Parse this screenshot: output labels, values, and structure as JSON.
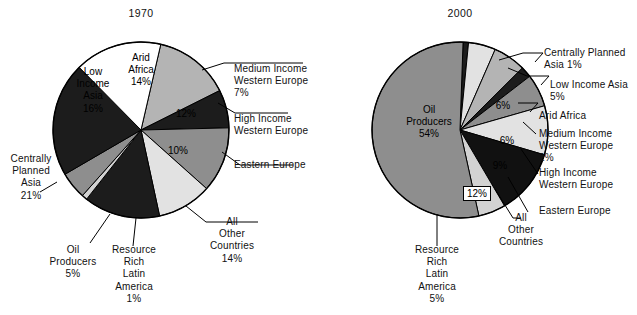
{
  "figure": {
    "background": "#ffffff",
    "line_color": "#000000"
  },
  "chart_data": [
    {
      "type": "pie",
      "title": "1970",
      "center": [
        141,
        130
      ],
      "radius": 88,
      "start_angle_deg": -77,
      "direction": "clockwise",
      "categories": [
        "Arid Africa",
        "Medium Income Western Europe",
        "High Income Western Europe",
        "Eastern Europe",
        "All Other Countries",
        "Resource Rich Latin America",
        "Oil Producers",
        "Centrally Planned Asia",
        "Low Income Asia"
      ],
      "values": [
        14,
        7,
        12,
        10,
        14,
        1,
        5,
        21,
        16
      ],
      "unit": "%",
      "colors": [
        "#b4b4b4",
        "#1c1c1c",
        "#8e8e8e",
        "#e2e2e2",
        "#1c1c1c",
        "#d2d2d2",
        "#8e8e8e",
        "#1c1c1c",
        "#ffffff"
      ],
      "slices": [
        {
          "label": "Arid Africa",
          "value": 14,
          "fill": "#b4b4b4",
          "label_in_pie": true,
          "label_text": "Arid\nAfrica\n14%"
        },
        {
          "label": "Medium Income Western Europe",
          "value": 7,
          "fill": "#1c1c1c",
          "label_in_pie": false,
          "label_text": "Medium Income\nWestern Europe\n7%"
        },
        {
          "label": "High Income Western Europe",
          "value": 12,
          "fill": "#8e8e8e",
          "label_in_pie": "value-only",
          "label_text": "High Income\nWestern Europe",
          "value_text": "12%"
        },
        {
          "label": "Eastern Europe",
          "value": 10,
          "fill": "#e2e2e2",
          "label_in_pie": "value-only",
          "label_text": "Eastern Europe",
          "value_text": "10%"
        },
        {
          "label": "All Other Countries",
          "value": 14,
          "fill": "#1c1c1c",
          "label_in_pie": false,
          "label_text": "All\nOther\nCountries\n14%"
        },
        {
          "label": "Resource Rich Latin America",
          "value": 1,
          "fill": "#d2d2d2",
          "label_in_pie": false,
          "label_text": "Resource\nRich\nLatin\nAmerica\n1%"
        },
        {
          "label": "Oil Producers",
          "value": 5,
          "fill": "#8e8e8e",
          "label_in_pie": false,
          "label_text": "Oil\nProducers\n5%"
        },
        {
          "label": "Centrally Planned Asia",
          "value": 21,
          "fill": "#1c1c1c",
          "label_in_pie": false,
          "label_text": "Centrally\nPlanned\nAsia\n21%"
        },
        {
          "label": "Low Income Asia",
          "value": 16,
          "fill": "#ffffff",
          "label_in_pie": true,
          "label_text": "Low\nIncome\nAsia\n16%"
        }
      ]
    },
    {
      "type": "pie",
      "title": "2000",
      "center": [
        460,
        130
      ],
      "radius": 88,
      "start_angle_deg": -88,
      "direction": "clockwise",
      "categories": [
        "Centrally Planned Asia",
        "Low Income Asia",
        "Arid Africa",
        "Medium Income Western Europe",
        "High Income Western Europe",
        "Eastern Europe",
        "All Other Countries",
        "Resource Rich Latin America",
        "Oil Producers"
      ],
      "values": [
        1,
        5,
        6,
        2,
        6,
        9,
        12,
        5,
        54
      ],
      "unit": "%",
      "colors": [
        "#1c1c1c",
        "#e2e2e2",
        "#b4b4b4",
        "#1c1c1c",
        "#8e8e8e",
        "#e2e2e2",
        "#111111",
        "#d2d2d2",
        "#8e8e8e"
      ],
      "slices": [
        {
          "label": "Centrally Planned Asia",
          "value": 1,
          "fill": "#1c1c1c",
          "label_in_pie": false,
          "label_text": "Centrally Planned\nAsia  1%"
        },
        {
          "label": "Low Income Asia",
          "value": 5,
          "fill": "#e2e2e2",
          "label_in_pie": false,
          "label_text": "Low Income Asia\n5%"
        },
        {
          "label": "Arid Africa",
          "value": 6,
          "fill": "#b4b4b4",
          "label_in_pie": "value-only",
          "label_text": "Arid Africa",
          "value_text": "6%"
        },
        {
          "label": "Medium Income Western Europe",
          "value": 2,
          "fill": "#1c1c1c",
          "label_in_pie": false,
          "label_text": "Medium Income\nWestern Europe\n2%"
        },
        {
          "label": "High Income Western Europe",
          "value": 6,
          "fill": "#8e8e8e",
          "label_in_pie": "value-only",
          "label_text": "High Income\nWestern Europe",
          "value_text": "6%"
        },
        {
          "label": "Eastern Europe",
          "value": 9,
          "fill": "#e2e2e2",
          "label_in_pie": "value-only",
          "label_text": "Eastern Europe",
          "value_text": "9%"
        },
        {
          "label": "All Other Countries",
          "value": 12,
          "fill": "#111111",
          "label_in_pie": "boxed",
          "label_text": "All\nOther\nCountries",
          "value_text": "12%"
        },
        {
          "label": "Resource Rich Latin America",
          "value": 5,
          "fill": "#d2d2d2",
          "label_in_pie": false,
          "label_text": "Resource\nRich\nLatin\nAmerica\n5%"
        },
        {
          "label": "Oil Producers",
          "value": 54,
          "fill": "#8e8e8e",
          "label_in_pie": true,
          "label_text": "Oil\nProducers\n54%"
        }
      ]
    }
  ],
  "left": {
    "title": "1970",
    "arid_africa": "Arid\nAfrica\n14%",
    "low_income_asia": "Low\nIncome\nAsia\n16%",
    "high_income_value": "12%",
    "eastern_europe_value": "10%",
    "medium_income_we": "Medium Income\nWestern Europe\n7%",
    "high_income_we": "High Income\nWestern Europe",
    "eastern_europe": "Eastern Europe",
    "all_other": "All\nOther\nCountries\n14%",
    "resource_rich": "Resource\nRich\nLatin\nAmerica\n1%",
    "oil_producers": "Oil\nProducers\n5%",
    "centrally_planned": "Centrally\nPlanned\nAsia\n21%"
  },
  "right": {
    "title": "2000",
    "oil_producers": "Oil\nProducers\n54%",
    "arid_africa_value": "6%",
    "high_income_value": "6%",
    "eastern_europe_value": "9%",
    "all_other_value": "12%",
    "centrally_planned": "Centrally Planned\nAsia  1%",
    "low_income_asia": "Low Income Asia\n5%",
    "arid_africa": "Arid Africa",
    "medium_income_we": "Medium Income\nWestern Europe\n2%",
    "high_income_we": "High Income\nWestern Europe",
    "eastern_europe": "Eastern Europe",
    "all_other": "All\nOther\nCountries",
    "resource_rich": "Resource\nRich\nLatin\nAmerica\n5%"
  }
}
